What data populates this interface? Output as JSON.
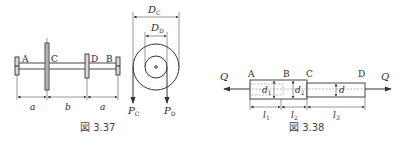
{
  "figures": [
    {
      "caption": "図 3.37",
      "shaft": {
        "labels": {
          "A": "A",
          "B": "B",
          "C": "C",
          "D": "D"
        },
        "dimensions": [
          "a",
          "b",
          "a"
        ]
      },
      "pulleys": {
        "outer_diameter_label": "D",
        "outer_diameter_sub": "C",
        "inner_diameter_label": "D",
        "inner_diameter_sub": "D",
        "force_left_label": "P",
        "force_left_sub": "C",
        "force_right_label": "P",
        "force_right_sub": "D"
      }
    },
    {
      "caption": "図 3.38",
      "bar": {
        "labels": {
          "A": "A",
          "B": "B",
          "C": "C",
          "D": "D"
        },
        "load_left": "Q",
        "load_right": "Q",
        "diam1_label": "d",
        "diam1_sub": "1",
        "diam2_label": "d",
        "diam2_sub": "2",
        "diam3_label": "d",
        "lengths": [
          {
            "label": "l",
            "sub": "1"
          },
          {
            "label": "l",
            "sub": "2"
          },
          {
            "label": "l",
            "sub": "3"
          }
        ]
      }
    }
  ]
}
